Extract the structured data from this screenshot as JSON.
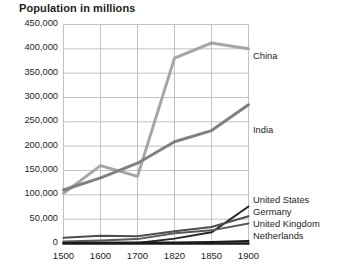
{
  "chart_data": {
    "type": "line",
    "title": "Population in millions",
    "xlabel": "",
    "ylabel": "",
    "x": [
      "1500",
      "1600",
      "1700",
      "1820",
      "1850",
      "1900"
    ],
    "ylim": [
      0,
      450000
    ],
    "yticks": [
      0,
      50000,
      100000,
      150000,
      200000,
      250000,
      300000,
      350000,
      400000,
      450000
    ],
    "ytick_labels": [
      "0",
      "50,000",
      "100,000",
      "150,000",
      "200,000",
      "250,000",
      "300,000",
      "350,000",
      "400,000",
      "450,000"
    ],
    "grid": true,
    "legend": "right-inline",
    "series": [
      {
        "name": "China",
        "color": "#a6a6a6",
        "width": 3.0,
        "values": [
          103000,
          160000,
          138000,
          381000,
          412000,
          400000
        ]
      },
      {
        "name": "India",
        "color": "#808080",
        "width": 3.0,
        "values": [
          110000,
          135000,
          165000,
          209000,
          232000,
          285000
        ]
      },
      {
        "name": "United States",
        "color": "#262626",
        "width": 2.0,
        "values": [
          2000,
          1500,
          1000,
          10000,
          23000,
          76000
        ]
      },
      {
        "name": "Germany",
        "color": "#4d4d4d",
        "width": 2.0,
        "values": [
          12000,
          16000,
          15000,
          25000,
          34000,
          56000
        ]
      },
      {
        "name": "United Kingdom",
        "color": "#595959",
        "width": 2.0,
        "values": [
          4000,
          6000,
          9000,
          21000,
          27000,
          41000
        ]
      },
      {
        "name": "Netherlands",
        "color": "#1a1a1a",
        "width": 2.0,
        "values": [
          1000,
          1500,
          2000,
          2300,
          3100,
          5100
        ]
      }
    ]
  }
}
